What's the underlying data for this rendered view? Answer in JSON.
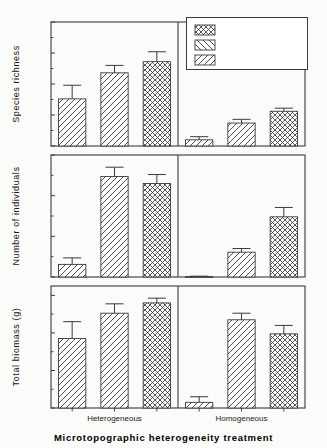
{
  "figure": {
    "xaxis_title": "Microtopographic heterogeneity treatment",
    "group_labels": [
      "Heterogeneous",
      "Homogeneous"
    ]
  },
  "legend": {
    "title": "",
    "items": [
      {
        "label": "seed bank+seeds",
        "pattern": "crosshatch"
      },
      {
        "label": "seeds",
        "pattern": "back-diagonal"
      },
      {
        "label": "seed bank",
        "pattern": "forward-diagonal"
      }
    ]
  },
  "chart_data": [
    {
      "type": "bar",
      "title": "",
      "ylabel": "Species richness",
      "xlabel": "Microtopographic heterogeneity treatment",
      "ylim": [
        0,
        20
      ],
      "yticks": [
        0,
        5,
        10,
        15,
        20
      ],
      "yticklabels": [
        "0",
        "5",
        "10",
        "15",
        "20"
      ],
      "grid": false,
      "legend_position": "upper right",
      "categories": [
        "Heterogeneous",
        "Homogeneous"
      ],
      "series": [
        {
          "name": "seed bank",
          "values": [
            7.6,
            1.0
          ],
          "errors": [
            2.2,
            0.5
          ]
        },
        {
          "name": "seeds",
          "values": [
            11.8,
            3.7
          ],
          "errors": [
            1.2,
            0.6
          ]
        },
        {
          "name": "seed bank+seeds",
          "values": [
            13.6,
            5.6
          ],
          "errors": [
            1.6,
            0.5
          ]
        }
      ]
    },
    {
      "type": "bar",
      "title": "",
      "ylabel": "Number of individuals",
      "xlabel": "Microtopographic heterogeneity treatment",
      "ylim": [
        0,
        300
      ],
      "yticks": [
        0,
        100,
        200,
        300
      ],
      "yticklabels": [
        "0",
        "100",
        "200",
        "300"
      ],
      "grid": false,
      "categories": [
        "Heterogeneous",
        "Homogeneous"
      ],
      "series": [
        {
          "name": "seed bank",
          "values": [
            31,
            1
          ],
          "errors": [
            16,
            1
          ]
        },
        {
          "name": "seeds",
          "values": [
            247,
            61
          ],
          "errors": [
            23,
            9
          ]
        },
        {
          "name": "seed bank+seeds",
          "values": [
            230,
            148
          ],
          "errors": [
            22,
            23
          ]
        }
      ]
    },
    {
      "type": "bar",
      "title": "",
      "ylabel": "Total biomass (g)",
      "xlabel": "Microtopographic heterogeneity treatment",
      "ylim": [
        0,
        65
      ],
      "yticks": [
        0,
        20,
        40,
        60
      ],
      "yticklabels": [
        "0",
        "20",
        "40",
        "60"
      ],
      "grid": false,
      "categories": [
        "Heterogeneous",
        "Homogeneous"
      ],
      "series": [
        {
          "name": "seed bank",
          "values": [
            37,
            3
          ],
          "errors": [
            9,
            3
          ]
        },
        {
          "name": "seeds",
          "values": [
            50.5,
            47
          ],
          "errors": [
            5,
            3.5
          ]
        },
        {
          "name": "seed bank+seeds",
          "values": [
            56,
            39.5
          ],
          "errors": [
            2.5,
            4.5
          ]
        }
      ]
    }
  ]
}
